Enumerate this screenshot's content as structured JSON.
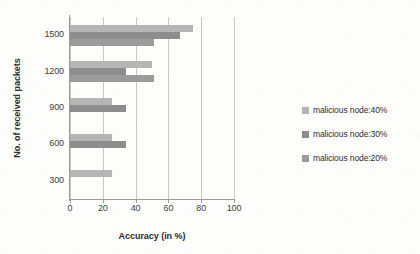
{
  "chart_data": {
    "type": "bar",
    "orientation": "horizontal",
    "title": "",
    "xlabel": "Accuracy (in %)",
    "ylabel": "No. of received packets",
    "categories": [
      "300",
      "600",
      "900",
      "1200",
      "1500"
    ],
    "categories_top_to_bottom": [
      "1500",
      "1200",
      "900",
      "600",
      "300"
    ],
    "xlim": [
      0,
      100
    ],
    "xticks": [
      0,
      20,
      40,
      60,
      80,
      100
    ],
    "xtick_labels": [
      "0",
      "20",
      "40",
      "60",
      "80",
      "100"
    ],
    "grid": "vertical",
    "legend_position": "right",
    "series": [
      {
        "name": "malicious node:40%",
        "color": "#b5b5b5",
        "values": [
          25.5,
          25.5,
          25.5,
          50,
          75
        ]
      },
      {
        "name": "malicious node:30%",
        "color": "#8d8d8d",
        "values": [
          0,
          34,
          34,
          34,
          67
        ]
      },
      {
        "name": "malicious node:20%",
        "color": "#9b9b9b",
        "values": [
          0,
          0,
          0,
          51,
          51
        ]
      }
    ]
  },
  "legend": {
    "items": [
      {
        "label": "malicious node:40%",
        "color": "#b5b5b5"
      },
      {
        "label": "malicious node:30%",
        "color": "#8d8d8d"
      },
      {
        "label": "malicious node:20%",
        "color": "#9b9b9b"
      }
    ]
  },
  "axes": {
    "x_title": "Accuracy (in %)",
    "y_title": "No. of received packets",
    "x_ticks": [
      "0",
      "20",
      "40",
      "60",
      "80",
      "100"
    ],
    "y_ticks": [
      "1500",
      "1200",
      "900",
      "600",
      "300"
    ]
  }
}
